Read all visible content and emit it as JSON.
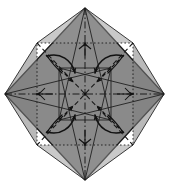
{
  "figure": {
    "type": "diagram",
    "background_color": "#ffffff",
    "paper_fill_color": "#8a8a8a",
    "paper_fill_color_shade": "#7e7e7e",
    "line_color": "#1a1a1a",
    "width": 169,
    "height": 188
  },
  "shape": {
    "name": "diamond",
    "vertices": {
      "top": {
        "x": 85,
        "y": 8
      },
      "right": {
        "x": 164,
        "y": 94
      },
      "bottom": {
        "x": 85,
        "y": 180
      },
      "left": {
        "x": 5,
        "y": 94
      }
    },
    "center": {
      "x": 85,
      "y": 94
    }
  },
  "inner_square": {
    "name": "dotted-inner-square",
    "style": "dotted",
    "corners": {
      "top_left": {
        "x": 37,
        "y": 43
      },
      "top_right": {
        "x": 133,
        "y": 43
      },
      "bottom_right": {
        "x": 133,
        "y": 145
      },
      "bottom_left": {
        "x": 37,
        "y": 145
      }
    }
  },
  "crease_square": {
    "name": "solid-crease-square",
    "style": "solid",
    "corners": {
      "top_left": {
        "x": 59,
        "y": 68
      },
      "top_right": {
        "x": 111,
        "y": 68
      },
      "bottom_right": {
        "x": 111,
        "y": 120
      },
      "bottom_left": {
        "x": 59,
        "y": 120
      }
    }
  },
  "creases": {
    "solid": [
      {
        "name": "crease-top-left-fan",
        "from": {
          "x": 85,
          "y": 8
        },
        "to": {
          "x": 37,
          "y": 43
        }
      },
      {
        "name": "crease-top-right-fan",
        "from": {
          "x": 85,
          "y": 8
        },
        "to": {
          "x": 133,
          "y": 43
        }
      },
      {
        "name": "crease-left-upper-fan",
        "from": {
          "x": 5,
          "y": 94
        },
        "to": {
          "x": 37,
          "y": 43
        }
      },
      {
        "name": "crease-left-lower-fan",
        "from": {
          "x": 5,
          "y": 94
        },
        "to": {
          "x": 37,
          "y": 145
        }
      },
      {
        "name": "crease-right-upper-fan",
        "from": {
          "x": 164,
          "y": 94
        },
        "to": {
          "x": 133,
          "y": 43
        }
      },
      {
        "name": "crease-right-lower-fan",
        "from": {
          "x": 164,
          "y": 94
        },
        "to": {
          "x": 133,
          "y": 145
        }
      },
      {
        "name": "crease-bottom-left-fan",
        "from": {
          "x": 85,
          "y": 180
        },
        "to": {
          "x": 37,
          "y": 145
        }
      },
      {
        "name": "crease-bottom-right-fan",
        "from": {
          "x": 85,
          "y": 180
        },
        "to": {
          "x": 133,
          "y": 145
        }
      },
      {
        "name": "crease-corner-top-to-bl",
        "from": {
          "x": 85,
          "y": 8
        },
        "to": {
          "x": 59,
          "y": 120
        }
      },
      {
        "name": "crease-corner-top-to-br",
        "from": {
          "x": 85,
          "y": 8
        },
        "to": {
          "x": 111,
          "y": 120
        }
      },
      {
        "name": "crease-corner-left-to-tr",
        "from": {
          "x": 5,
          "y": 94
        },
        "to": {
          "x": 111,
          "y": 68
        }
      },
      {
        "name": "crease-corner-left-to-br",
        "from": {
          "x": 5,
          "y": 94
        },
        "to": {
          "x": 111,
          "y": 120
        }
      },
      {
        "name": "crease-corner-right-to-tl",
        "from": {
          "x": 164,
          "y": 94
        },
        "to": {
          "x": 59,
          "y": 68
        }
      },
      {
        "name": "crease-corner-right-to-bl",
        "from": {
          "x": 164,
          "y": 94
        },
        "to": {
          "x": 59,
          "y": 120
        }
      },
      {
        "name": "crease-corner-bottom-to-tl",
        "from": {
          "x": 85,
          "y": 180
        },
        "to": {
          "x": 59,
          "y": 68
        }
      },
      {
        "name": "crease-corner-bottom-to-tr",
        "from": {
          "x": 85,
          "y": 180
        },
        "to": {
          "x": 111,
          "y": 68
        }
      }
    ],
    "dash_dot": [
      {
        "name": "axis-vertical",
        "from": {
          "x": 85,
          "y": 8
        },
        "to": {
          "x": 85,
          "y": 180
        }
      },
      {
        "name": "axis-horizontal",
        "from": {
          "x": 5,
          "y": 94
        },
        "to": {
          "x": 164,
          "y": 94
        }
      }
    ],
    "dashed_diagonals": [
      {
        "name": "diagonal-tl-br",
        "from": {
          "x": 37,
          "y": 43
        },
        "to": {
          "x": 133,
          "y": 145
        }
      },
      {
        "name": "diagonal-tr-bl",
        "from": {
          "x": 133,
          "y": 43
        },
        "to": {
          "x": 37,
          "y": 145
        }
      }
    ]
  },
  "arrows": {
    "curved": [
      {
        "name": "twist-arrow-top-left",
        "direction": "down-right",
        "quadrant": "top-left"
      },
      {
        "name": "twist-arrow-top-right",
        "direction": "down-left",
        "quadrant": "top-right"
      },
      {
        "name": "twist-arrow-bottom-left",
        "direction": "up-right",
        "quadrant": "bottom-left"
      },
      {
        "name": "twist-arrow-bottom-right",
        "direction": "up-left",
        "quadrant": "bottom-right"
      }
    ],
    "straight_dashed": [
      {
        "name": "fold-arrow-tl-inward",
        "from": {
          "x": 46,
          "y": 55
        },
        "to": {
          "x": 73,
          "y": 82
        }
      },
      {
        "name": "fold-arrow-tr-inward",
        "from": {
          "x": 124,
          "y": 55
        },
        "to": {
          "x": 97,
          "y": 82
        }
      },
      {
        "name": "fold-arrow-bl-inward",
        "from": {
          "x": 46,
          "y": 133
        },
        "to": {
          "x": 73,
          "y": 106
        }
      },
      {
        "name": "fold-arrow-br-inward",
        "from": {
          "x": 124,
          "y": 133
        },
        "to": {
          "x": 97,
          "y": 106
        }
      },
      {
        "name": "tick-arrow-top",
        "from": {
          "x": 85,
          "y": 57
        },
        "to": {
          "x": 85,
          "y": 41
        }
      },
      {
        "name": "tick-arrow-bottom",
        "from": {
          "x": 85,
          "y": 131
        },
        "to": {
          "x": 85,
          "y": 147
        }
      },
      {
        "name": "tick-arrow-left",
        "from": {
          "x": 53,
          "y": 94
        },
        "to": {
          "x": 35,
          "y": 94
        }
      },
      {
        "name": "tick-arrow-right",
        "from": {
          "x": 117,
          "y": 94
        },
        "to": {
          "x": 135,
          "y": 94
        }
      }
    ]
  }
}
